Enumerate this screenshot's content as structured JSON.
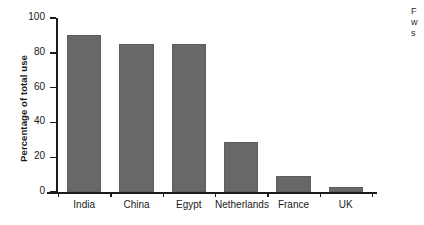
{
  "chart_data": {
    "type": "bar",
    "title": "",
    "subtitle": "",
    "xlabel": "",
    "ylabel": "Percentage of total use",
    "categories": [
      "India",
      "China",
      "Egypt",
      "Netherlands",
      "France",
      "UK"
    ],
    "values": [
      90,
      85,
      85,
      29,
      9,
      3
    ],
    "ylim": [
      0,
      100
    ],
    "yticks": [
      0,
      20,
      40,
      60,
      80,
      100
    ],
    "ytick_labels": [
      "0",
      "20",
      "40",
      "60",
      "80",
      "100"
    ],
    "grid": false,
    "legend": null,
    "bar_color": "#686868",
    "axis_color": "#1a1a1a",
    "background": "#ffffff",
    "annotations": []
  },
  "side_caption": {
    "line1": "F",
    "line2": "w",
    "line3": "s"
  }
}
